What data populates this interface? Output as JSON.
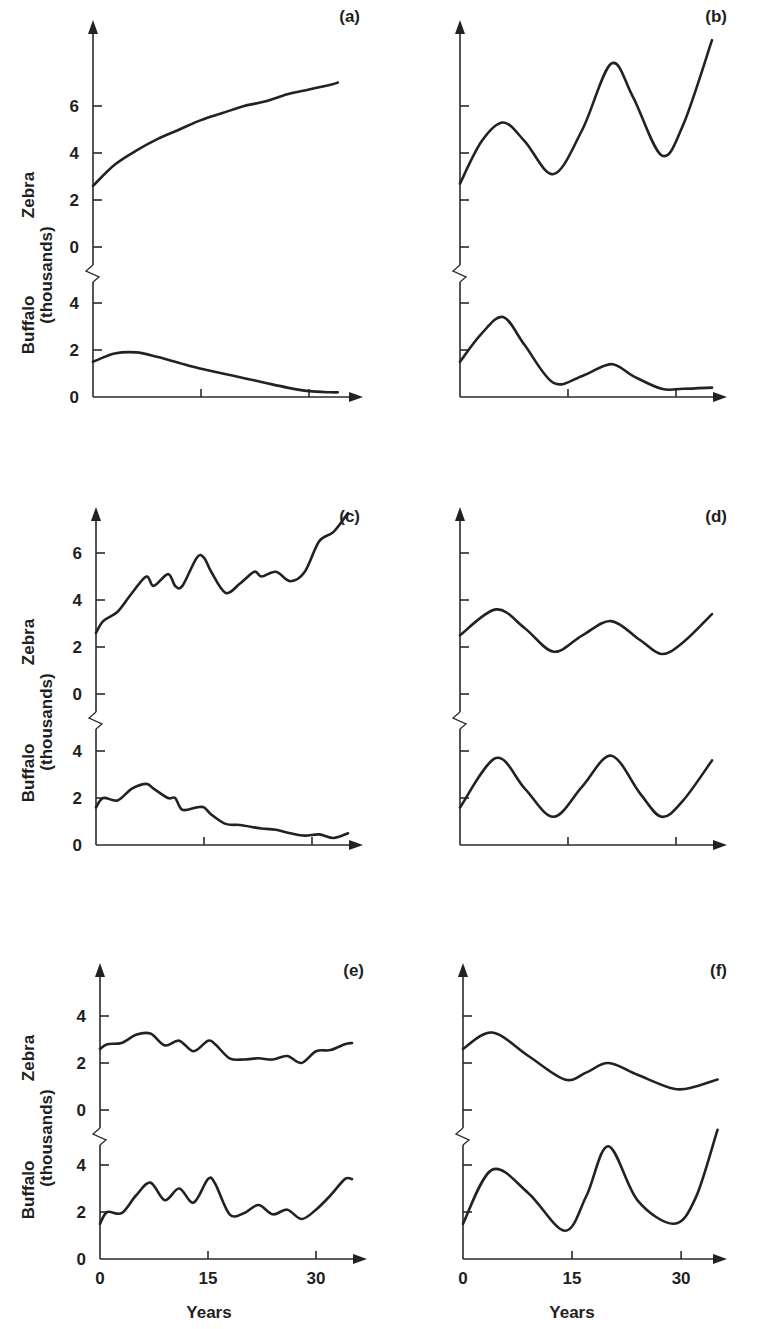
{
  "figure": {
    "ylabel_species_top": "Zebra",
    "ylabel_units": "(thousands)",
    "ylabel_species_bottom": "Buffalo",
    "xlabel": "Years",
    "x_tick_labels": [
      "0",
      "15",
      "30"
    ],
    "line_color": "#222222"
  },
  "chart_data": [
    {
      "type": "line",
      "panel": "(a)",
      "xlabel": "",
      "ylabel": "Zebra / Buffalo (thousands)",
      "x": [
        0,
        3,
        6,
        9,
        12,
        15,
        18,
        21,
        24,
        27,
        30,
        33,
        34
      ],
      "zebra_yticks": [
        0,
        2,
        4,
        6
      ],
      "buffalo_yticks": [
        0,
        2,
        4
      ],
      "series": [
        {
          "name": "Zebra",
          "values": [
            2.6,
            3.5,
            4.1,
            4.6,
            5.0,
            5.4,
            5.7,
            6.0,
            6.2,
            6.5,
            6.7,
            6.9,
            7.0
          ]
        },
        {
          "name": "Buffalo",
          "values": [
            1.5,
            1.85,
            1.9,
            1.7,
            1.45,
            1.2,
            1.0,
            0.8,
            0.6,
            0.4,
            0.25,
            0.2,
            0.2
          ]
        }
      ]
    },
    {
      "type": "line",
      "panel": "(b)",
      "xlabel": "",
      "ylabel": "",
      "x": [
        0,
        3,
        6,
        9,
        13,
        17,
        21,
        24,
        28,
        31,
        35
      ],
      "zebra_yticks": [
        0,
        2,
        4,
        6
      ],
      "buffalo_yticks": [
        0,
        2,
        4
      ],
      "series": [
        {
          "name": "Zebra",
          "values": [
            2.7,
            4.5,
            5.3,
            4.5,
            3.1,
            5.0,
            7.8,
            6.4,
            3.9,
            5.2,
            8.8
          ]
        },
        {
          "name": "Buffalo",
          "values": [
            1.5,
            2.7,
            3.4,
            2.2,
            0.6,
            0.9,
            1.4,
            0.9,
            0.35,
            0.35,
            0.4
          ]
        }
      ]
    },
    {
      "type": "line",
      "panel": "(c)",
      "xlabel": "",
      "ylabel": "Zebra / Buffalo (thousands)",
      "x": [
        0,
        1,
        3,
        5,
        7,
        8,
        10,
        11,
        12,
        14,
        15,
        16,
        18,
        20,
        22,
        23,
        25,
        27,
        29,
        31,
        33,
        35
      ],
      "zebra_yticks": [
        0,
        2,
        4,
        6
      ],
      "buffalo_yticks": [
        0,
        2,
        4
      ],
      "series": [
        {
          "name": "Zebra",
          "values": [
            2.6,
            3.1,
            3.5,
            4.3,
            5.0,
            4.6,
            5.1,
            4.6,
            4.6,
            5.8,
            5.8,
            5.2,
            4.3,
            4.7,
            5.2,
            5.0,
            5.2,
            4.8,
            5.2,
            6.5,
            6.9,
            7.7
          ]
        },
        {
          "name": "Buffalo",
          "values": [
            1.6,
            2.0,
            1.9,
            2.4,
            2.6,
            2.4,
            2.0,
            2.0,
            1.5,
            1.6,
            1.6,
            1.3,
            0.9,
            0.85,
            0.75,
            0.7,
            0.65,
            0.5,
            0.4,
            0.45,
            0.3,
            0.5
          ]
        }
      ]
    },
    {
      "type": "line",
      "panel": "(d)",
      "xlabel": "",
      "ylabel": "",
      "x": [
        0,
        5,
        9,
        13,
        17,
        21,
        25,
        28,
        31,
        35
      ],
      "zebra_yticks": [
        0,
        2,
        4,
        6
      ],
      "buffalo_yticks": [
        0,
        2,
        4
      ],
      "series": [
        {
          "name": "Zebra",
          "values": [
            2.5,
            3.6,
            2.8,
            1.8,
            2.5,
            3.1,
            2.3,
            1.7,
            2.2,
            3.4
          ]
        },
        {
          "name": "Buffalo",
          "values": [
            1.6,
            3.7,
            2.4,
            1.2,
            2.5,
            3.8,
            2.2,
            1.2,
            1.9,
            3.6
          ]
        }
      ]
    },
    {
      "type": "line",
      "panel": "(e)",
      "xlabel": "Years",
      "ylabel": "Zebra / Buffalo (thousands)",
      "x": [
        0,
        1,
        3,
        5,
        7,
        9,
        11,
        13,
        15,
        16,
        18,
        20,
        22,
        24,
        26,
        28,
        30,
        32,
        34,
        35
      ],
      "x_ticks": [
        0,
        15,
        30
      ],
      "zebra_yticks": [
        0,
        2,
        4
      ],
      "buffalo_yticks": [
        0,
        2,
        4
      ],
      "series": [
        {
          "name": "Zebra",
          "values": [
            2.6,
            2.8,
            2.85,
            3.2,
            3.25,
            2.75,
            2.95,
            2.5,
            2.95,
            2.8,
            2.2,
            2.15,
            2.2,
            2.15,
            2.3,
            2.0,
            2.5,
            2.55,
            2.8,
            2.85
          ]
        },
        {
          "name": "Buffalo",
          "values": [
            1.5,
            2.0,
            1.95,
            2.7,
            3.25,
            2.5,
            3.0,
            2.4,
            3.4,
            3.2,
            1.9,
            1.95,
            2.3,
            1.9,
            2.1,
            1.7,
            2.1,
            2.7,
            3.4,
            3.4
          ]
        }
      ]
    },
    {
      "type": "line",
      "panel": "(f)",
      "xlabel": "Years",
      "ylabel": "",
      "x": [
        0,
        4,
        9,
        14,
        17,
        20,
        24,
        29,
        32,
        35
      ],
      "x_ticks": [
        0,
        15,
        30
      ],
      "zebra_yticks": [
        0,
        2,
        4
      ],
      "buffalo_yticks": [
        0,
        2,
        4
      ],
      "series": [
        {
          "name": "Zebra",
          "values": [
            2.6,
            3.3,
            2.3,
            1.3,
            1.6,
            2.0,
            1.5,
            0.9,
            1.0,
            1.3
          ]
        },
        {
          "name": "Buffalo",
          "values": [
            1.5,
            3.8,
            2.8,
            1.2,
            2.7,
            4.8,
            2.5,
            1.5,
            2.6,
            5.5
          ]
        }
      ]
    }
  ],
  "layout": [
    {
      "ox": 93,
      "zero_zebra": 247,
      "zero_buffalo": 397,
      "top": 20,
      "xend": 363,
      "yr_px": 7.2,
      "unit_px": 23.5,
      "break_y": 265,
      "label_x": 360,
      "label_y": 22,
      "show_yticks_labels": true,
      "show_x_labels": false
    },
    {
      "ox": 460,
      "zero_zebra": 247,
      "zero_buffalo": 397,
      "top": 20,
      "xend": 727,
      "yr_px": 7.2,
      "unit_px": 23.5,
      "break_y": 265,
      "label_x": 727,
      "label_y": 22,
      "show_yticks_labels": false,
      "show_x_labels": false
    },
    {
      "ox": 96,
      "zero_zebra": 694,
      "zero_buffalo": 845,
      "top": 507,
      "xend": 363,
      "yr_px": 7.2,
      "unit_px": 23.5,
      "break_y": 712,
      "label_x": 360,
      "label_y": 522,
      "show_yticks_labels": true,
      "show_x_labels": false
    },
    {
      "ox": 460,
      "zero_zebra": 694,
      "zero_buffalo": 845,
      "top": 507,
      "xend": 727,
      "yr_px": 7.2,
      "unit_px": 23.5,
      "break_y": 712,
      "label_x": 727,
      "label_y": 522,
      "show_yticks_labels": false,
      "show_x_labels": false
    },
    {
      "ox": 100,
      "zero_zebra": 1110,
      "zero_buffalo": 1259,
      "top": 963,
      "xend": 367,
      "yr_px": 7.2,
      "unit_px": 23.5,
      "break_y": 1128,
      "label_x": 364,
      "label_y": 976,
      "show_yticks_labels": true,
      "show_x_labels": true
    },
    {
      "ox": 463,
      "zero_zebra": 1110,
      "zero_buffalo": 1259,
      "top": 963,
      "xend": 727,
      "yr_px": 7.27,
      "unit_px": 23.5,
      "break_y": 1128,
      "label_x": 727,
      "label_y": 976,
      "show_yticks_labels": false,
      "show_x_labels": true
    }
  ]
}
